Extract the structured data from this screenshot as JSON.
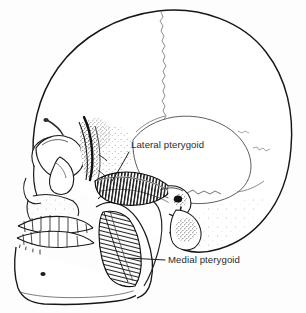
{
  "figure": {
    "name": "lateral-skull-pterygoid-muscles",
    "background_color": "#fdfdfd",
    "ink_color": "#1a1a1a",
    "label_color": "#2b2b2b",
    "width": 306,
    "height": 313
  },
  "labels": [
    {
      "id": "lateral-pterygoid",
      "text": "Lateral pterygoid",
      "x": 131,
      "y": 148,
      "leader": {
        "from_x": 129,
        "from_y": 152,
        "to_x": 112,
        "to_y": 181
      }
    },
    {
      "id": "medial-pterygoid",
      "text": "Medial pterygoid",
      "x": 168,
      "y": 263,
      "leader": {
        "from_x": 165,
        "from_y": 260,
        "to_x": 128,
        "to_y": 258
      }
    }
  ],
  "structures": [
    {
      "id": "cranial-vault",
      "label": "Cranial vault"
    },
    {
      "id": "coronal-suture",
      "label": "Coronal suture"
    },
    {
      "id": "parietal-bone",
      "label": "Parietal bone"
    },
    {
      "id": "temporal-bone",
      "label": "Temporal bone"
    },
    {
      "id": "occipital-bone",
      "label": "Occipital bone"
    },
    {
      "id": "frontal-bone",
      "label": "Frontal bone"
    },
    {
      "id": "orbit",
      "label": "Orbital cavity"
    },
    {
      "id": "nasal-aperture",
      "label": "Nasal aperture"
    },
    {
      "id": "zygomatic-arch",
      "label": "Zygomatic arch"
    },
    {
      "id": "maxilla",
      "label": "Maxilla"
    },
    {
      "id": "upper-teeth",
      "label": "Upper dental arch"
    },
    {
      "id": "lower-teeth",
      "label": "Lower dental arch"
    },
    {
      "id": "mandible-body",
      "label": "Mandibular body"
    },
    {
      "id": "mandibular-ramus",
      "label": "Mandibular ramus"
    },
    {
      "id": "mental-foramen",
      "label": "Mental foramen"
    },
    {
      "id": "condyle",
      "label": "Mandibular condyle"
    },
    {
      "id": "styloid-process",
      "label": "Styloid process"
    },
    {
      "id": "mastoid-process",
      "label": "Mastoid process"
    },
    {
      "id": "pterygoid-plate",
      "label": "Pterygoid plate"
    },
    {
      "id": "lateral-pterygoid-muscle",
      "label": "Lateral pterygoid muscle"
    },
    {
      "id": "medial-pterygoid-muscle",
      "label": "Medial pterygoid muscle"
    }
  ]
}
